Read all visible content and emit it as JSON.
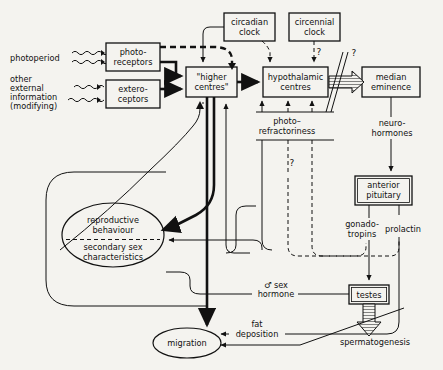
{
  "diagram": {
    "nodes": {
      "photoperiod": "photoperiod",
      "other_external": [
        "other",
        "external",
        "information",
        "(modifying)"
      ],
      "photoreceptors": [
        "photo-",
        "receptors"
      ],
      "exteroceptors": [
        "extero-",
        "ceptors"
      ],
      "higher_centres": [
        "\"higher",
        "centres\""
      ],
      "circadian_clock": [
        "circadian",
        "clock"
      ],
      "circennial_clock": [
        "circennial",
        "clock"
      ],
      "hypothalamic_centres": [
        "hypothalamic",
        "centres"
      ],
      "median_eminence": [
        "median",
        "eminence"
      ],
      "anterior_pituitary": [
        "anterior",
        "pituitary"
      ],
      "testes": "testes",
      "reproductive_ellipse_top": [
        "reproductive",
        "behaviour"
      ],
      "reproductive_ellipse_bottom": [
        "secondary  sex",
        "characteristics"
      ],
      "migration": "migration"
    },
    "edge_labels": {
      "photo_refractoriness": [
        "photo–",
        "refractoriness"
      ],
      "neurohormones": [
        "neuro-",
        "hormones"
      ],
      "gonadotropins": [
        "gonado-",
        "tropins"
      ],
      "prolactin": "prolactin",
      "sex_hormone": [
        "♂ sex",
        "hormone"
      ],
      "spermatogenesis": "spermatogenesis",
      "fat_deposition": [
        "fat",
        "deposition"
      ]
    },
    "annotations": {
      "q1": "?",
      "q2": "?",
      "q3": "?"
    },
    "colors": {
      "background": "#f4f3ef",
      "ink": "#111111"
    }
  }
}
